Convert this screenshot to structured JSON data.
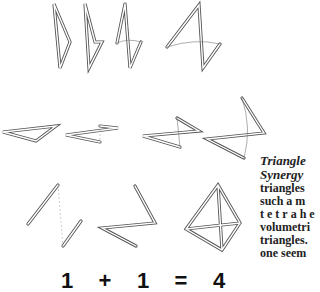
{
  "caption": {
    "title_line1": "Triangle",
    "title_line2": "Synergy",
    "body_lines": [
      "triangles",
      "such a m",
      "tetrahe",
      "volumetri",
      "triangles.",
      "one seem"
    ]
  },
  "equation": {
    "terms": [
      "1",
      "+",
      "1",
      "=",
      "4"
    ]
  },
  "figures": {
    "row1": "four folding triangle sequence (vertical)",
    "row2": "four folding triangle sequence (horizontal)",
    "row3": "two triangles combine into tetrahedron"
  }
}
